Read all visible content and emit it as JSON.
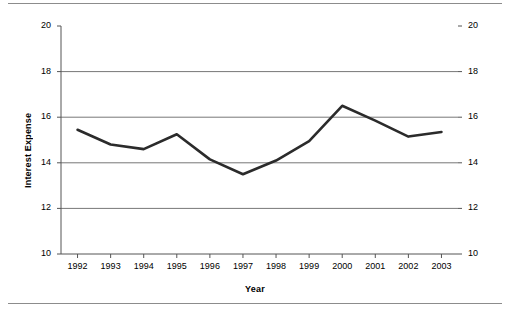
{
  "chart_data": {
    "type": "line",
    "title": "",
    "xlabel": "Year",
    "ylabel": "Interest Expense",
    "categories": [
      "1992",
      "1993",
      "1994",
      "1995",
      "1996",
      "1997",
      "1998",
      "1999",
      "2000",
      "2001",
      "2002",
      "2003"
    ],
    "values": [
      15.45,
      14.8,
      14.6,
      15.25,
      14.15,
      13.5,
      14.1,
      14.95,
      16.5,
      15.85,
      15.15,
      15.35
    ],
    "x": [
      1992,
      1993,
      1994,
      1995,
      1996,
      1997,
      1998,
      1999,
      2000,
      2001,
      2002,
      2003
    ],
    "ylim": [
      10,
      20
    ],
    "y_ticks": [
      10,
      12,
      14,
      16,
      18,
      20
    ],
    "y_tick_labels": [
      "10",
      "12",
      "14",
      "16",
      "18",
      "20"
    ],
    "y_gridlines": [
      12,
      14,
      16,
      18
    ],
    "grid": true,
    "legend": null,
    "legend_position": "none",
    "second_y_axis": {
      "mirrored": true,
      "ticks": [
        10,
        12,
        14,
        16,
        18,
        20
      ],
      "tick_labels": [
        "10",
        "12",
        "14",
        "16",
        "18",
        "20"
      ]
    },
    "series": [
      {
        "name": "Interest Expense",
        "values": [
          15.45,
          14.8,
          14.6,
          15.25,
          14.15,
          13.5,
          14.1,
          14.95,
          16.5,
          15.85,
          15.15,
          15.35
        ],
        "color": "#2b2b2b",
        "line_width": 2.6,
        "markers": false
      }
    ],
    "colors": {
      "line": "#2b2b2b",
      "axis": "#555555",
      "grid": "#777777",
      "text": "#000000",
      "background": "#ffffff",
      "rule": "#8c8c8c"
    },
    "annotations": []
  },
  "figure": {
    "top_rule": "horizontal-rule",
    "bottom_rule": "horizontal-rule"
  }
}
